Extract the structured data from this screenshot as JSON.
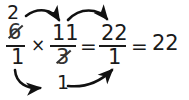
{
  "document": {
    "kind": "handwritten-math-worksheet",
    "title": "Fraction multiplication with cross-cancellation",
    "background_color": "#ffffff",
    "ink_color": "#1a1a1a"
  },
  "expression": {
    "full_text": "6/1 × 11/3 = 22/1 = 22",
    "plain": "6 over 1 times 11 over 3 equals 22 over 1 equals 22",
    "result": "22"
  },
  "terms": {
    "first_fraction": {
      "name": "first-fraction",
      "numerator_original": "6",
      "numerator_cancelled": true,
      "numerator_replacement": "2",
      "denominator_original": "1",
      "denominator_cancelled": false,
      "denominator_replacement": "1"
    },
    "second_fraction": {
      "name": "second-fraction",
      "numerator_original": "11",
      "numerator_cancelled": false,
      "denominator_original": "3",
      "denominator_cancelled": true,
      "denominator_replacement": "1"
    },
    "result_fraction": {
      "name": "result-fraction",
      "numerator": "22",
      "denominator": "1"
    },
    "final_value": "22"
  },
  "operators": {
    "multiply": "×",
    "equals_first": "=",
    "equals_second": "="
  },
  "annotations": {
    "cancel_note_top": "2",
    "cancel_note_bottom": "1",
    "arrows": [
      {
        "id": "arrow-top-left",
        "label": "numerator-2-to-numerator-11",
        "from": "first-fraction-numerator",
        "to": "second-fraction-numerator",
        "direction": "right-down",
        "position": "above"
      },
      {
        "id": "arrow-top-right",
        "label": "numerator-11-to-result-numerator",
        "from": "second-fraction-numerator",
        "to": "result-numerator",
        "direction": "right-down",
        "position": "above"
      },
      {
        "id": "arrow-bottom-left",
        "label": "denominator-1-to-denominator-1",
        "from": "first-fraction-denominator",
        "to": "second-fraction-denominator",
        "direction": "right-down",
        "position": "below"
      },
      {
        "id": "arrow-bottom-right",
        "label": "denominator-1-to-result-denominator",
        "from": "second-fraction-denominator",
        "to": "result-denominator",
        "direction": "right-up",
        "position": "below"
      }
    ]
  },
  "colors": {
    "ink": "#1a1a1a",
    "cancel_ink": "#333333",
    "background": "#ffffff",
    "arrow": "#111111"
  }
}
